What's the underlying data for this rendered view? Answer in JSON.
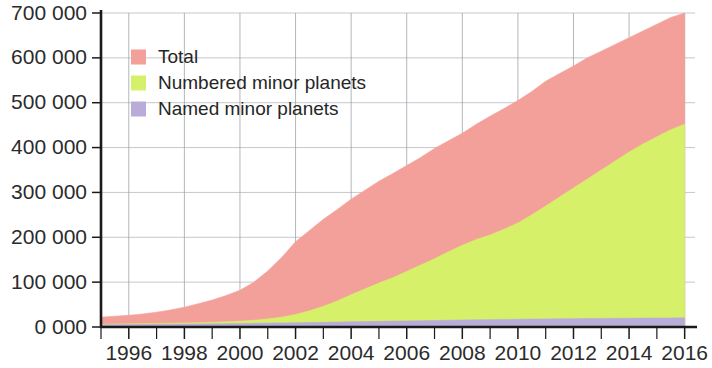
{
  "chart_data": {
    "type": "area",
    "title": "",
    "subtitle": "",
    "xlabel": "",
    "ylabel": "",
    "stacked": true,
    "grid": true,
    "legend_position": "top-left",
    "xlim": [
      1995.0,
      2016.3
    ],
    "ylim": [
      0,
      700000
    ],
    "y_ticks": [
      0,
      100000,
      200000,
      300000,
      400000,
      500000,
      600000,
      700000
    ],
    "y_tick_labels": [
      "0 000",
      "100 000",
      "200 000",
      "300 000",
      "400 000",
      "500 000",
      "600 000",
      "700 000"
    ],
    "x_ticks": [
      1996,
      1998,
      2000,
      2002,
      2004,
      2006,
      2008,
      2010,
      2012,
      2014,
      2016
    ],
    "x_tick_labels": [
      "1996",
      "1998",
      "2000",
      "2002",
      "2004",
      "2006",
      "2008",
      "2010",
      "2012",
      "2014",
      "2016"
    ],
    "x_minor_ticks": [
      1995,
      1997,
      1999,
      2001,
      2003,
      2005,
      2007,
      2009,
      2011,
      2013,
      2015
    ],
    "x": [
      1995.0,
      1995.5,
      1996.0,
      1996.5,
      1997.0,
      1997.5,
      1998.0,
      1998.5,
      1999.0,
      1999.5,
      2000.0,
      2000.5,
      2001.0,
      2001.5,
      2002.0,
      2002.5,
      2003.0,
      2003.5,
      2004.0,
      2004.5,
      2005.0,
      2005.5,
      2006.0,
      2006.5,
      2007.0,
      2007.5,
      2008.0,
      2008.5,
      2009.0,
      2009.5,
      2010.0,
      2010.5,
      2011.0,
      2011.5,
      2012.0,
      2012.5,
      2013.0,
      2013.5,
      2014.0,
      2014.5,
      2015.0,
      2015.5,
      2016.0
    ],
    "series": [
      {
        "name": "Total",
        "color": "#F4A09A",
        "legend_label": "Total",
        "values": [
          22000,
          24000,
          26000,
          29000,
          33000,
          38000,
          44000,
          52000,
          60000,
          70000,
          82000,
          100000,
          125000,
          155000,
          190000,
          215000,
          240000,
          262000,
          285000,
          305000,
          325000,
          342000,
          360000,
          378000,
          398000,
          415000,
          432000,
          452000,
          470000,
          487000,
          505000,
          525000,
          548000,
          565000,
          582000,
          600000,
          615000,
          630000,
          645000,
          660000,
          675000,
          690000,
          700000
        ]
      },
      {
        "name": "Numbered minor planets",
        "color": "#D7F06A",
        "legend_label": "Numbered minor planets",
        "values": [
          6000,
          6500,
          7000,
          7500,
          8000,
          8500,
          9000,
          9500,
          10500,
          11500,
          13000,
          15000,
          18000,
          22000,
          28000,
          36000,
          46000,
          58000,
          72000,
          85000,
          98000,
          110000,
          124000,
          138000,
          152000,
          168000,
          182000,
          195000,
          205000,
          218000,
          232000,
          250000,
          270000,
          290000,
          310000,
          330000,
          350000,
          370000,
          390000,
          408000,
          424000,
          440000,
          452000
        ]
      },
      {
        "name": "Named minor planets",
        "color": "#B9ACD8",
        "legend_label": "Named minor planets",
        "values": [
          5000,
          5200,
          5400,
          5600,
          5900,
          6200,
          6500,
          6800,
          7100,
          7500,
          7900,
          8300,
          8700,
          9100,
          9500,
          10000,
          10500,
          11000,
          11600,
          12100,
          12600,
          13100,
          13600,
          14100,
          14600,
          15100,
          15600,
          16000,
          16400,
          16800,
          17200,
          17600,
          18000,
          18300,
          18600,
          18900,
          19200,
          19400,
          19600,
          19800,
          20000,
          20200,
          20400
        ]
      }
    ]
  },
  "legend": {
    "items": [
      {
        "label": "Total",
        "color": "#F4A09A"
      },
      {
        "label": "Numbered minor planets",
        "color": "#D7F06A"
      },
      {
        "label": "Named minor planets",
        "color": "#B9ACD8"
      }
    ]
  },
  "colors": {
    "total": "#F4A09A",
    "numbered": "#D7F06A",
    "named": "#B9ACD8",
    "axis": "#1a1a1a",
    "grid": "#9aa0a6",
    "text": "#2b2b2b",
    "background": "#ffffff"
  }
}
